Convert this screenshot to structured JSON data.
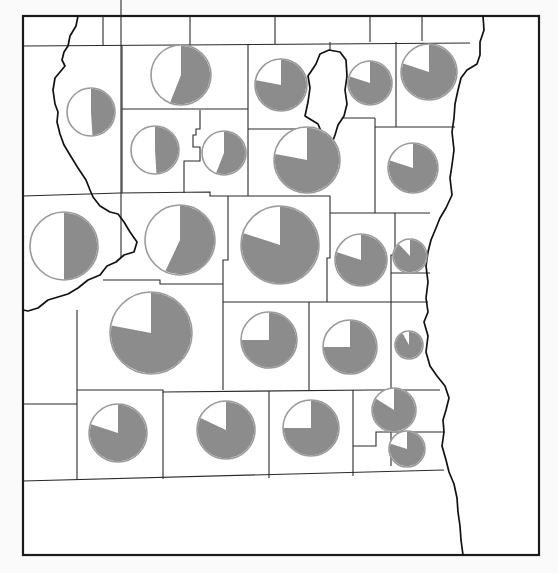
{
  "map": {
    "title": "",
    "width": 558,
    "height": 573,
    "colors": {
      "background": "#ffffff",
      "border": "#1a1a1a",
      "pie_fill": "#8c8c8c",
      "pie_remainder": "#ffffff",
      "pie_outline": "#9a9a9a"
    },
    "legend": null
  },
  "pies": [
    {
      "id": 1,
      "cx": 91,
      "cy": 112,
      "r": 24,
      "share": 0.49
    },
    {
      "id": 2,
      "cx": 181,
      "cy": 75,
      "r": 30,
      "share": 0.56
    },
    {
      "id": 3,
      "cx": 281,
      "cy": 85,
      "r": 26,
      "share": 0.78
    },
    {
      "id": 4,
      "cx": 370,
      "cy": 83,
      "r": 22,
      "share": 0.8
    },
    {
      "id": 5,
      "cx": 429,
      "cy": 72,
      "r": 28,
      "share": 0.8
    },
    {
      "id": 6,
      "cx": 155,
      "cy": 150,
      "r": 24,
      "share": 0.49
    },
    {
      "id": 7,
      "cx": 224,
      "cy": 153,
      "r": 22,
      "share": 0.56
    },
    {
      "id": 8,
      "cx": 307,
      "cy": 160,
      "r": 33,
      "share": 0.78
    },
    {
      "id": 9,
      "cx": 413,
      "cy": 168,
      "r": 25,
      "share": 0.8
    },
    {
      "id": 10,
      "cx": 64,
      "cy": 246,
      "r": 34,
      "share": 0.5
    },
    {
      "id": 11,
      "cx": 180,
      "cy": 240,
      "r": 35,
      "share": 0.57
    },
    {
      "id": 12,
      "cx": 280,
      "cy": 245,
      "r": 39,
      "share": 0.8
    },
    {
      "id": 13,
      "cx": 361,
      "cy": 260,
      "r": 26,
      "share": 0.8
    },
    {
      "id": 14,
      "cx": 410,
      "cy": 256,
      "r": 17,
      "share": 0.88
    },
    {
      "id": 15,
      "cx": 151,
      "cy": 333,
      "r": 41,
      "share": 0.78
    },
    {
      "id": 16,
      "cx": 269,
      "cy": 340,
      "r": 28,
      "share": 0.75
    },
    {
      "id": 17,
      "cx": 350,
      "cy": 347,
      "r": 27,
      "share": 0.75
    },
    {
      "id": 18,
      "cx": 409,
      "cy": 345,
      "r": 14,
      "share": 0.92
    },
    {
      "id": 19,
      "cx": 118,
      "cy": 433,
      "r": 29,
      "share": 0.8
    },
    {
      "id": 20,
      "cx": 226,
      "cy": 430,
      "r": 29,
      "share": 0.82
    },
    {
      "id": 21,
      "cx": 311,
      "cy": 428,
      "r": 28,
      "share": 0.75
    },
    {
      "id": 22,
      "cx": 394,
      "cy": 410,
      "r": 22,
      "share": 0.84
    },
    {
      "id": 23,
      "cx": 407,
      "cy": 449,
      "r": 18,
      "share": 0.8
    }
  ],
  "chart_data": {
    "type": "pie",
    "title": "",
    "legend": [],
    "series": [
      {
        "name": "gray share",
        "values": [
          0.49,
          0.56,
          0.78,
          0.8,
          0.8,
          0.49,
          0.56,
          0.78,
          0.8,
          0.5,
          0.57,
          0.8,
          0.8,
          0.88,
          0.78,
          0.75,
          0.75,
          0.92,
          0.8,
          0.82,
          0.75,
          0.84,
          0.8
        ]
      }
    ],
    "relative_sizes": [
      24,
      30,
      26,
      22,
      28,
      24,
      22,
      33,
      25,
      34,
      35,
      39,
      26,
      17,
      41,
      28,
      27,
      14,
      29,
      29,
      28,
      22,
      18
    ]
  }
}
